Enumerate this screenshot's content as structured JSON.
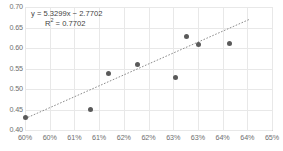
{
  "chart_data": {
    "type": "scatter",
    "title": "",
    "xlabel": "",
    "ylabel": "",
    "xlim": [
      0.6,
      0.65
    ],
    "ylim": [
      0.4,
      0.7
    ],
    "grid": true,
    "legend": false,
    "x_tick_labels": [
      "60%",
      "60%",
      "61%",
      "61%",
      "62%",
      "62%",
      "63%",
      "63%",
      "64%",
      "64%",
      "65%"
    ],
    "x_tick_values": [
      0.6,
      0.605,
      0.61,
      0.615,
      0.62,
      0.625,
      0.63,
      0.635,
      0.64,
      0.645,
      0.65
    ],
    "y_tick_labels": [
      "0.40",
      "0.45",
      "0.50",
      "0.55",
      "0.60",
      "0.65",
      "0.70"
    ],
    "y_tick_values": [
      0.4,
      0.45,
      0.5,
      0.55,
      0.6,
      0.65,
      0.7
    ],
    "series": [
      {
        "name": "data",
        "marker": "circle",
        "color": "#5a5a5a",
        "points": [
          {
            "x": 0.6,
            "y": 0.431
          },
          {
            "x": 0.6133,
            "y": 0.45
          },
          {
            "x": 0.617,
            "y": 0.539
          },
          {
            "x": 0.6228,
            "y": 0.56
          },
          {
            "x": 0.6305,
            "y": 0.528
          },
          {
            "x": 0.6327,
            "y": 0.628
          },
          {
            "x": 0.6352,
            "y": 0.609
          },
          {
            "x": 0.6414,
            "y": 0.612
          }
        ]
      }
    ],
    "trendline": {
      "type": "linear",
      "style": "dotted",
      "color": "#8c8c8c",
      "slope": 5.3299,
      "intercept": -2.7702,
      "r_squared": 0.7702,
      "x_start": 0.6,
      "x_end": 0.6456
    },
    "annotation": {
      "equation": "y = 5.3299x − 2.7702",
      "r_squared_prefix": "R",
      "r_squared_exponent": "2",
      "r_squared_value": " = 0.7702"
    },
    "colors": {
      "marker": "#5a5a5a",
      "trendline": "#8c8c8c",
      "gridline": "#e8e8e8",
      "axis": "#d0d0d0",
      "tick_label": "#6e6e6e",
      "annotation_text": "#3f3f3f",
      "background": "#ffffff"
    }
  }
}
